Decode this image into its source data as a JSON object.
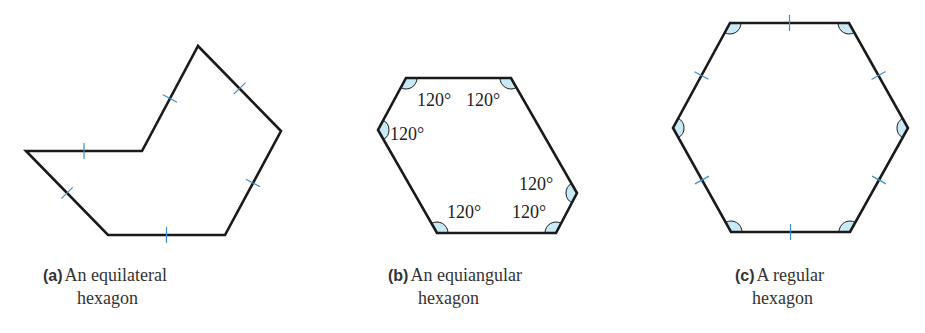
{
  "figure": {
    "stroke_color": "#1a1a1a",
    "tick_color": "#3b8fd0",
    "angle_fill": "#c9e9f6",
    "panels": [
      {
        "id": "a",
        "tag": "(a)",
        "caption_line1": "An equilateral",
        "caption_line2": "hexagon",
        "property": "all sides equal",
        "vertices": [
          [
            26,
            151
          ],
          [
            142,
            151
          ],
          [
            198,
            46
          ],
          [
            281,
            131
          ],
          [
            225,
            235
          ],
          [
            108,
            235
          ]
        ],
        "side_ticks": 6,
        "angle_marks": 0,
        "angle_labels": []
      },
      {
        "id": "b",
        "tag": "(b)",
        "caption_line1": "An equiangular",
        "caption_line2": "hexagon",
        "property": "all angles equal",
        "vertices": [
          [
            406,
            78
          ],
          [
            511,
            78
          ],
          [
            577,
            193
          ],
          [
            556,
            233
          ],
          [
            437,
            233
          ],
          [
            378,
            130
          ]
        ],
        "side_ticks": 0,
        "angle_marks": 6,
        "angle_labels": [
          "120°",
          "120°",
          "120°",
          "120°",
          "120°",
          "120°"
        ]
      },
      {
        "id": "c",
        "tag": "(c)",
        "caption_line1": "A regular",
        "caption_line2": "hexagon",
        "property": "all sides and angles equal",
        "vertices": [
          [
            730,
            23
          ],
          [
            849,
            23
          ],
          [
            908,
            128
          ],
          [
            850,
            232
          ],
          [
            731,
            232
          ],
          [
            673,
            128
          ]
        ],
        "side_ticks": 6,
        "angle_marks": 6,
        "angle_labels": []
      }
    ]
  }
}
